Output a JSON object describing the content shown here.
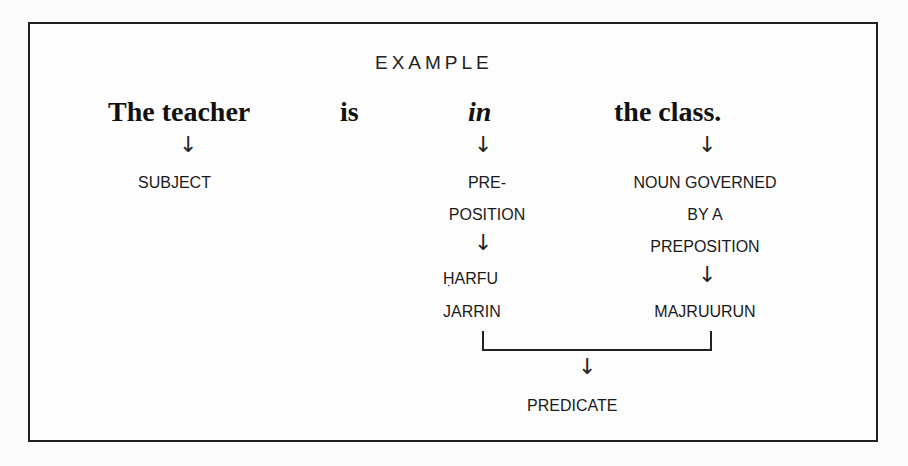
{
  "diagram": {
    "title": "EXAMPLE",
    "sentence": [
      {
        "text": "The teacher",
        "style": "bold"
      },
      {
        "text": "is",
        "style": "bold"
      },
      {
        "text": "in",
        "style": "bold-italic"
      },
      {
        "text": "the class.",
        "style": "bold"
      }
    ],
    "arrow_glyph": "↓",
    "labels": {
      "subject": "SUBJECT",
      "preposition_1": "PRE-",
      "preposition_2": "POSITION",
      "harfu": "ḤARFU",
      "jarrin": "JARRIN",
      "noun_1": "NOUN GOVERNED",
      "noun_2": "BY A",
      "noun_3": "PREPOSITION",
      "majruurun": "MAJRUURUN",
      "predicate": "PREDICATE"
    }
  }
}
